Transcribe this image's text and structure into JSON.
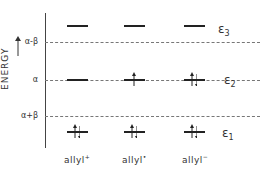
{
  "diagram": {
    "axis_label": "ENERGY",
    "energy_ticks": [
      {
        "label": "α-β",
        "y": 42
      },
      {
        "label": "α",
        "y": 80
      },
      {
        "label": "α+β",
        "y": 116
      }
    ],
    "levels": [
      {
        "name": "ε3",
        "sub": "3",
        "symbol": "ε"
      },
      {
        "name": "ε2",
        "sub": "2",
        "symbol": "ε"
      },
      {
        "name": "ε1",
        "sub": "1",
        "symbol": "ε"
      }
    ],
    "species": [
      {
        "name": "allyl",
        "charge": "+",
        "e3": "empty",
        "e2": "empty",
        "e1": "paired"
      },
      {
        "name": "allyl",
        "charge": "•",
        "e3": "empty",
        "e2": "single",
        "e1": "paired"
      },
      {
        "name": "allyl",
        "charge": "−",
        "e3": "empty",
        "e2": "paired",
        "e1": "paired"
      }
    ]
  }
}
